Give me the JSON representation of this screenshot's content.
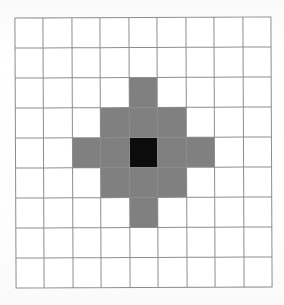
{
  "figure": {
    "background_color": "#fefefe"
  },
  "grid": {
    "columns": 9,
    "rows": 9,
    "line_color": "#8d8d8d",
    "line_width_px": 1,
    "cell_width_px": 28.5,
    "cell_height_px": 30.1,
    "origin_x_px": 15,
    "origin_y_px": 17,
    "total_width_px": 257,
    "total_height_px": 271,
    "empty_cell_color": "#ffffff"
  },
  "legend": {
    "black_label": "center cell",
    "black_color": "#0c0c0c",
    "gray_label": "neighborhood cell",
    "gray_color": "#808080",
    "white_label": "empty cell",
    "white_color": "#ffffff"
  },
  "chart_data": {
    "type": "heatmap",
    "xlabel": "",
    "ylabel": "",
    "grid": true,
    "legend_position": "none",
    "categories_x": [
      "0",
      "1",
      "2",
      "3",
      "4",
      "5",
      "6",
      "7",
      "8"
    ],
    "categories_y": [
      "0",
      "1",
      "2",
      "3",
      "4",
      "5",
      "6",
      "7",
      "8"
    ],
    "center_cell": {
      "col": 4,
      "row": 4
    },
    "value_colors": {
      "0": "#ffffff",
      "1": "#808080",
      "2": "#0c0c0c"
    },
    "values": [
      [
        0,
        0,
        0,
        0,
        0,
        0,
        0,
        0,
        0
      ],
      [
        0,
        0,
        0,
        0,
        0,
        0,
        0,
        0,
        0
      ],
      [
        0,
        0,
        0,
        0,
        1,
        0,
        0,
        0,
        0
      ],
      [
        0,
        0,
        0,
        1,
        1,
        1,
        0,
        0,
        0
      ],
      [
        0,
        0,
        1,
        1,
        2,
        1,
        1,
        0,
        0
      ],
      [
        0,
        0,
        0,
        1,
        1,
        1,
        0,
        0,
        0
      ],
      [
        0,
        0,
        0,
        0,
        1,
        0,
        0,
        0,
        0
      ],
      [
        0,
        0,
        0,
        0,
        0,
        0,
        0,
        0,
        0
      ],
      [
        0,
        0,
        0,
        0,
        0,
        0,
        0,
        0,
        0
      ]
    ]
  }
}
